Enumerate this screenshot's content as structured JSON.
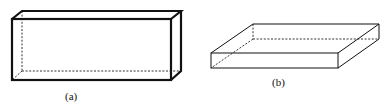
{
  "figure": {
    "panels": [
      {
        "id": "a",
        "label": "(a)",
        "shape": "tall rectangular box (slab standing on edge)"
      },
      {
        "id": "b",
        "label": "(b)",
        "shape": "flat rectangular box (slab lying flat)"
      }
    ]
  }
}
